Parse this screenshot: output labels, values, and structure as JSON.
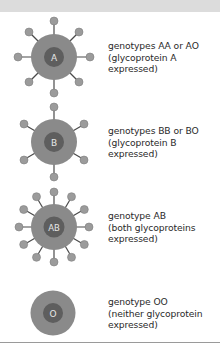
{
  "header": {
    "title": ""
  },
  "colors": {
    "header_bg": "#dcdcdc",
    "cell_outer": "#8a8a8a",
    "cell_inner": "#5e5e5e",
    "antigen_knob": "#9b9b9b",
    "antigen_stalk": "#4a4a4a",
    "label_text": "#2a2a2a",
    "rule": "#9a9a9a"
  },
  "cells": [
    {
      "id": "A",
      "core_label": "A",
      "antigen_count": 8,
      "label_lines": [
        "genotypes AA or AO",
        "(glycoprotein A",
        "expressed)"
      ]
    },
    {
      "id": "B",
      "core_label": "B",
      "antigen_count": 6,
      "label_lines": [
        "genotypes BB or BO",
        "(glycoprotein B",
        "expressed)"
      ]
    },
    {
      "id": "AB",
      "core_label": "AB",
      "antigen_count": 12,
      "label_lines": [
        "genotype AB",
        "(both glycoproteins",
        "expressed)"
      ]
    },
    {
      "id": "O",
      "core_label": "O",
      "antigen_count": 0,
      "label_lines": [
        "genotype OO",
        "(neither glycoprotein",
        "expressed)"
      ]
    }
  ]
}
